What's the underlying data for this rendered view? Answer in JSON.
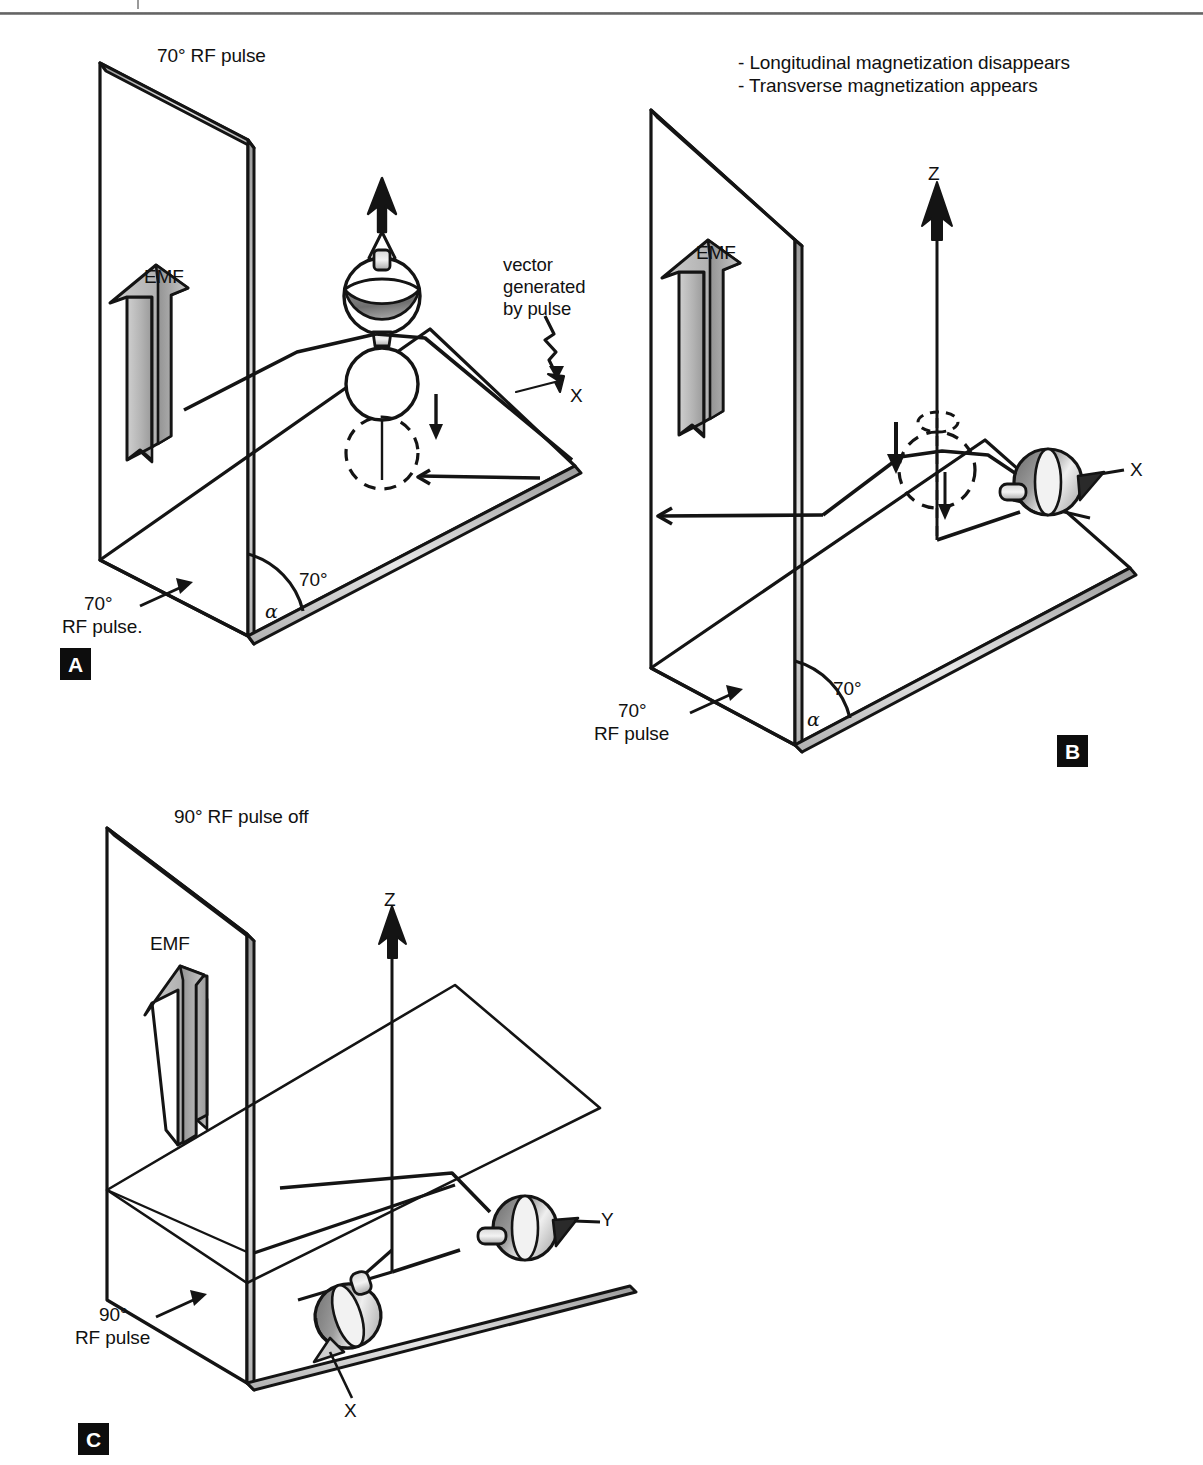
{
  "figure": {
    "title_implied": "MRI RF pulse vector diagram",
    "header_rule": true
  },
  "panels": [
    {
      "id": "A",
      "badge": "A",
      "title": "70° RF pulse",
      "emf_label": "EMF",
      "angle_value": "70°",
      "angle_symbol": "α",
      "pulse_label_line1": "70°",
      "pulse_label_line2": "RF pulse.",
      "callout_line1": "vector",
      "callout_line2": "generated",
      "callout_line3": "by pulse",
      "axes": [
        "X"
      ]
    },
    {
      "id": "B",
      "badge": "B",
      "note_line1": "- Longitudinal magnetization disappears",
      "note_line2": "- Transverse magnetization appears",
      "emf_label": "EMF",
      "angle_value": "70°",
      "angle_symbol": "α",
      "pulse_label_line1": "70°",
      "pulse_label_line2": "RF pulse",
      "axes": [
        "Z",
        "X"
      ]
    },
    {
      "id": "C",
      "badge": "C",
      "title": "90° RF pulse off",
      "emf_label": "EMF",
      "pulse_label_line1": "90°",
      "pulse_label_line2": "RF pulse",
      "axes": [
        "Z",
        "Y",
        "X"
      ]
    }
  ],
  "labels": {
    "panelA_title": "70° RF pulse",
    "panelA_emf": "EMF",
    "panelA_vector_l1": "vector",
    "panelA_vector_l2": "generated",
    "panelA_vector_l3": "by pulse",
    "panelA_axis_x": "X",
    "panelA_angle": "70°",
    "panelA_alpha": "α",
    "panelA_pulse_l1": "70°",
    "panelA_pulse_l2": "RF pulse.",
    "panelA_badge": "A",
    "panelB_note1": "- Longitudinal magnetization disappears",
    "panelB_note2": "- Transverse magnetization appears",
    "panelB_emf": "EMF",
    "panelB_axis_z": "Z",
    "panelB_axis_x": "X",
    "panelB_angle": "70°",
    "panelB_alpha": "α",
    "panelB_pulse_l1": "70°",
    "panelB_pulse_l2": "RF pulse",
    "panelB_badge": "B",
    "panelC_title": "90° RF pulse off",
    "panelC_emf": "EMF",
    "panelC_axis_z": "Z",
    "panelC_axis_y": "Y",
    "panelC_axis_x": "X",
    "panelC_pulse_l1": "90°",
    "panelC_pulse_l2": "RF pulse",
    "panelC_badge": "C"
  },
  "colors": {
    "ink": "#111111",
    "badge_bg": "#0d0d0d",
    "badge_fg": "#ffffff",
    "arrow_fill": "#b8b8b8",
    "arrow_fill_dark": "#8f8f8f",
    "top_shade_dark": "#6e6e6e",
    "top_shade_light": "#d8d8d8",
    "rule": "#6a6a6a",
    "page_bg": "#ffffff"
  }
}
